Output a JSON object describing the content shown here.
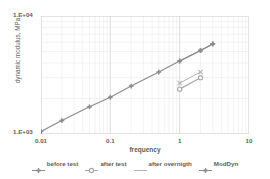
{
  "chart_data": {
    "type": "line",
    "title": "",
    "xlabel": "frequency",
    "ylabel": "dynamic modulus, MPa",
    "xscale": "log",
    "yscale": "log",
    "xlim": [
      0.01,
      10
    ],
    "ylim": [
      1000,
      10000
    ],
    "xticks": [
      "0.01",
      "0.1",
      "1",
      "10"
    ],
    "yticks": [
      "1.E+03",
      "1.E+04"
    ],
    "grid": true,
    "legend_position": "bottom",
    "series": [
      {
        "name": "before test",
        "marker": "cross-bar",
        "color": "#8c8c8c",
        "x": [
          0.01,
          0.02,
          0.05,
          0.1,
          0.2,
          0.5,
          1.0,
          2.0,
          3.0
        ],
        "y": [
          1050,
          1300,
          1700,
          2050,
          2550,
          3350,
          4150,
          5100,
          5800
        ]
      },
      {
        "name": "after test",
        "marker": "circle-open",
        "color": "#a8a8a8",
        "x": [
          1.0,
          2.0
        ],
        "y": [
          2400,
          3000
        ]
      },
      {
        "name": "after overnigth",
        "marker": "line",
        "color": "#b5b5b5",
        "x": [
          1.0,
          2.0
        ],
        "y": [
          2700,
          3350
        ]
      },
      {
        "name": "ModDyn",
        "marker": "cross-bar",
        "color": "#8c8c8c",
        "x": [
          1.0,
          2.0,
          3.0
        ],
        "y": [
          4150,
          5100,
          5800
        ]
      }
    ]
  },
  "axes": {
    "y_top_label": "1.E+04",
    "y_bottom_label": "1.E+03",
    "y_title": "dynamic modulus, MPa",
    "x_title": "frequency",
    "x_tick_labels": [
      "0.01",
      "0.1",
      "1",
      "10"
    ]
  },
  "legend": {
    "items": [
      {
        "label": "before test",
        "symbol": "cross-bar-icon"
      },
      {
        "label": "after test",
        "symbol": "circle-open-icon"
      },
      {
        "label": "after overnigth",
        "symbol": "line-icon"
      },
      {
        "label": "ModDyn",
        "symbol": "cross-bar-icon"
      }
    ]
  },
  "colors": {
    "line_primary": "#8c8c8c",
    "line_secondary": "#a8a8a8",
    "line_tertiary": "#b5b5b5",
    "grid": "#dcdcdc",
    "text": "#5e5e5e"
  }
}
